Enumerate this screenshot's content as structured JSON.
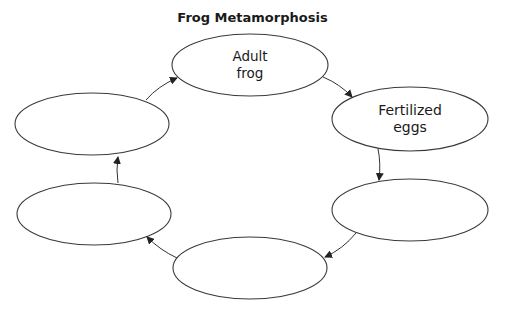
{
  "title": "Frog Metamorphosis",
  "colors": {
    "stroke": "#3a3a3a",
    "text": "#1a1a1a",
    "background": "#ffffff"
  },
  "nodes": [
    {
      "id": "adult-frog",
      "line1": "Adult",
      "line2": "frog",
      "cx": 250,
      "cy": 65,
      "rx": 78,
      "ry": 31
    },
    {
      "id": "fertilized-eggs",
      "line1": "Fertilized",
      "line2": "eggs",
      "cx": 410,
      "cy": 119,
      "rx": 78,
      "ry": 32
    },
    {
      "id": "blank-lower-right",
      "line1": "",
      "line2": "",
      "cx": 410,
      "cy": 210,
      "rx": 78,
      "ry": 31
    },
    {
      "id": "blank-bottom",
      "line1": "",
      "line2": "",
      "cx": 250,
      "cy": 268,
      "rx": 77,
      "ry": 31
    },
    {
      "id": "blank-lower-left",
      "line1": "",
      "line2": "",
      "cx": 94,
      "cy": 214,
      "rx": 77,
      "ry": 31
    },
    {
      "id": "blank-upper-left",
      "line1": "",
      "line2": "",
      "cx": 92,
      "cy": 124,
      "rx": 77,
      "ry": 31
    }
  ],
  "edges": [
    {
      "from": "blank-upper-left",
      "to": "adult-frog"
    },
    {
      "from": "adult-frog",
      "to": "fertilized-eggs"
    },
    {
      "from": "fertilized-eggs",
      "to": "blank-lower-right"
    },
    {
      "from": "blank-lower-right",
      "to": "blank-bottom"
    },
    {
      "from": "blank-bottom",
      "to": "blank-lower-left"
    },
    {
      "from": "blank-lower-left",
      "to": "blank-upper-left"
    }
  ]
}
